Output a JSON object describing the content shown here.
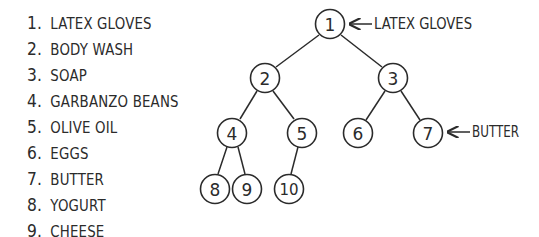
{
  "list": {
    "items": [
      {
        "num": "1.",
        "label": "LATEX GLOVES"
      },
      {
        "num": "2.",
        "label": "BODY WASH"
      },
      {
        "num": "3.",
        "label": "SOAP"
      },
      {
        "num": "4.",
        "label": "GARBANZO BEANS"
      },
      {
        "num": "5.",
        "label": "OLIVE OIL"
      },
      {
        "num": "6.",
        "label": "EGGS"
      },
      {
        "num": "7.",
        "label": "BUTTER"
      },
      {
        "num": "8.",
        "label": "YOGURT"
      },
      {
        "num": "9.",
        "label": "CHEESE"
      }
    ]
  },
  "tree": {
    "nodes": [
      {
        "id": "1",
        "label": "1"
      },
      {
        "id": "2",
        "label": "2"
      },
      {
        "id": "3",
        "label": "3"
      },
      {
        "id": "4",
        "label": "4"
      },
      {
        "id": "5",
        "label": "5"
      },
      {
        "id": "6",
        "label": "6"
      },
      {
        "id": "7",
        "label": "7"
      },
      {
        "id": "8",
        "label": "8"
      },
      {
        "id": "9",
        "label": "9"
      },
      {
        "id": "10",
        "label": "10"
      }
    ],
    "edges": [
      [
        "1",
        "2"
      ],
      [
        "1",
        "3"
      ],
      [
        "2",
        "4"
      ],
      [
        "2",
        "5"
      ],
      [
        "3",
        "6"
      ],
      [
        "3",
        "7"
      ],
      [
        "4",
        "8"
      ],
      [
        "4",
        "9"
      ],
      [
        "5",
        "10"
      ]
    ],
    "callouts": [
      {
        "node": "1",
        "text": "LATEX GLOVES"
      },
      {
        "node": "7",
        "text": "BUTTER"
      }
    ]
  }
}
